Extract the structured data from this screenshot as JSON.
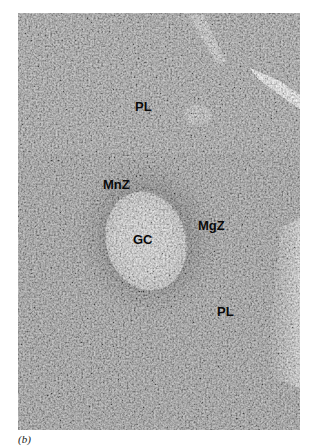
{
  "figure": {
    "caption": "(b)",
    "labels": [
      {
        "id": "pl-top",
        "text": "PL",
        "x": 135,
        "y": 100
      },
      {
        "id": "mnz",
        "text": "MnZ",
        "x": 103,
        "y": 178
      },
      {
        "id": "gc",
        "text": "GC",
        "x": 133,
        "y": 233
      },
      {
        "id": "mgz",
        "text": "MgZ",
        "x": 198,
        "y": 219
      },
      {
        "id": "pl-bottom",
        "text": "PL",
        "x": 217,
        "y": 305
      }
    ],
    "colors": {
      "tissue_mid": "#8e8e8e",
      "germinal_center": "#d6d6d6",
      "label": "#0a0a0a",
      "background": "#ffffff"
    }
  }
}
